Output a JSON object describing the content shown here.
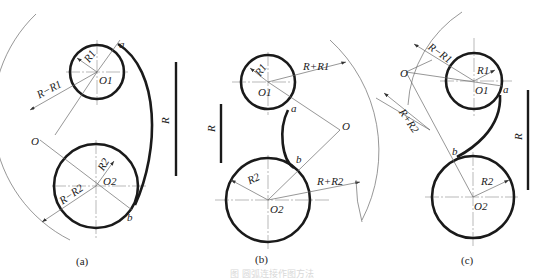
{
  "figure": {
    "caption_faint": "图 圆弧连接作图方法",
    "panels": [
      {
        "id": "a",
        "caption": "(a)",
        "labels": {
          "r1": "R1",
          "r2": "R2",
          "o1": "O1",
          "o2": "O2",
          "o": "O",
          "point_a": "a",
          "point_b": "b",
          "dim1": "R−R1",
          "dim2": "R−R2",
          "scale": "R"
        }
      },
      {
        "id": "b",
        "caption": "(b)",
        "labels": {
          "r1": "R1",
          "r2": "R2",
          "o1": "O1",
          "o2": "O2",
          "o": "O",
          "point_a": "a",
          "point_b": "b",
          "dim1": "R+R1",
          "dim2": "R+R2",
          "scale": "R"
        }
      },
      {
        "id": "c",
        "caption": "(c)",
        "labels": {
          "r1": "R1",
          "r2": "R2",
          "o1": "O1",
          "o2": "O2",
          "o": "O",
          "point_a": "a",
          "point_b": "b",
          "dim1": "R−R1",
          "dim2": "R+R2",
          "scale": "R"
        }
      }
    ]
  }
}
